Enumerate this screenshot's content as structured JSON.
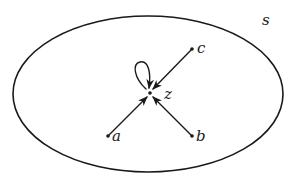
{
  "diagram": {
    "type": "directed-graph-in-set",
    "colors": {
      "ink": "#1a1a1a",
      "background": "#ffffff"
    },
    "set": {
      "label": "s"
    },
    "nodes": [
      {
        "id": "z",
        "label": "z"
      },
      {
        "id": "a",
        "label": "a"
      },
      {
        "id": "b",
        "label": "b"
      },
      {
        "id": "c",
        "label": "c"
      }
    ],
    "edges": [
      {
        "from": "a",
        "to": "z"
      },
      {
        "from": "b",
        "to": "z"
      },
      {
        "from": "c",
        "to": "z"
      },
      {
        "from": "z",
        "to": "z",
        "kind": "self-loop"
      }
    ]
  }
}
